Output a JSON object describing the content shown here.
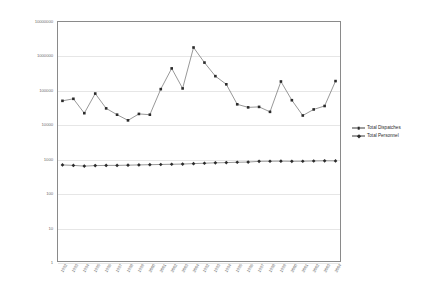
{
  "chart_data": {
    "type": "line",
    "title": "",
    "subtitle": "",
    "xlabel": "",
    "ylabel": "",
    "yscale": "log",
    "ylim": [
      1,
      10000000
    ],
    "grid": true,
    "legend_position": "right",
    "ytick_labels": [
      "10000000",
      "1000000",
      "100000",
      "10000",
      "1000",
      "100",
      "10",
      "1"
    ],
    "ytick_values": [
      10000000,
      1000000,
      100000,
      10000,
      1000,
      100,
      10,
      1
    ],
    "categories": [
      "1992",
      "1993",
      "1994",
      "1995",
      "1996",
      "1997",
      "1998",
      "1999",
      "2000",
      "2001",
      "2002",
      "2003",
      "2004",
      "1992",
      "1993",
      "1994",
      "1995",
      "1996",
      "1997",
      "1998",
      "1999",
      "2000",
      "2001",
      "2002",
      "2003",
      "2004"
    ],
    "x": [
      "1992",
      "1993",
      "1994",
      "1995",
      "1996",
      "1997",
      "1998",
      "1999",
      "2000",
      "2001",
      "2002",
      "2003",
      "2004",
      "1992",
      "1993",
      "1994",
      "1995",
      "1996",
      "1997",
      "1998",
      "1999",
      "2000",
      "2001",
      "2002",
      "2003",
      "2004"
    ],
    "series": [
      {
        "name": "Total Dispatches",
        "marker": "square",
        "color": "#2b2b2b",
        "values": [
          48000,
          55000,
          21000,
          78000,
          29000,
          19000,
          13000,
          20000,
          19000,
          105000,
          420000,
          110000,
          1700000,
          620000,
          250000,
          145000,
          38000,
          31000,
          32000,
          23000,
          175000,
          50000,
          18000,
          27000,
          34000,
          180000
        ]
      },
      {
        "name": "Total Personnel",
        "marker": "diamond",
        "color": "#2b2b2b",
        "values": [
          660,
          640,
          610,
          630,
          640,
          640,
          650,
          660,
          670,
          680,
          690,
          700,
          720,
          740,
          760,
          770,
          790,
          800,
          840,
          845,
          850,
          840,
          845,
          860,
          870,
          865
        ]
      }
    ],
    "legend": [
      "Total Dispatches",
      "Total Personnel"
    ]
  },
  "legend": {
    "items": [
      {
        "label": "Total Dispatches"
      },
      {
        "label": "Total Personnel"
      }
    ]
  }
}
